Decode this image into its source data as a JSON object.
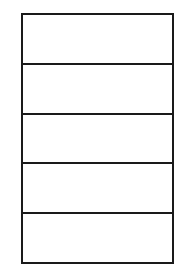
{
  "diagram": {
    "type": "stacked-boxes",
    "orientation": "vertical",
    "cell_count": 5,
    "stroke_color": "#1a1a1a",
    "fill_color": "#ffffff",
    "cells": [
      {
        "label": ""
      },
      {
        "label": ""
      },
      {
        "label": ""
      },
      {
        "label": ""
      },
      {
        "label": ""
      }
    ]
  }
}
